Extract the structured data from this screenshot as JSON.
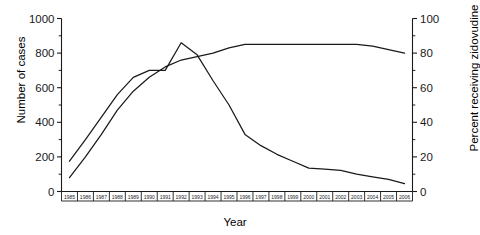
{
  "chart_data": {
    "type": "line",
    "title": "",
    "xlabel": "Year",
    "ylabel": "Number of cases",
    "ylabel_right": "Percent receiving zidovudine",
    "grid": false,
    "legend": "none",
    "x": [
      1985,
      1986,
      1987,
      1988,
      1989,
      1990,
      1991,
      1992,
      1993,
      1994,
      1995,
      1996,
      1997,
      1998,
      1999,
      2000,
      2001,
      2002,
      2003,
      2004,
      2005,
      2006
    ],
    "xtick_labels": [
      "1985",
      "1986",
      "1987",
      "1988",
      "1989",
      "1990",
      "1991",
      "1992",
      "1993",
      "1994",
      "1995",
      "1996",
      "1997",
      "1998",
      "1999",
      "2000",
      "2001",
      "2002",
      "2003",
      "2004",
      "2005",
      "2006"
    ],
    "ylim": [
      0,
      1000
    ],
    "ytick_labels": [
      "0",
      "200",
      "400",
      "600",
      "800",
      "1000"
    ],
    "ytick_values": [
      0,
      200,
      400,
      600,
      800,
      1000
    ],
    "ylim_right": [
      0,
      100
    ],
    "ytick_labels_right": [
      "0",
      "20",
      "40",
      "60",
      "80",
      "100"
    ],
    "ytick_values_right": [
      0,
      20,
      40,
      60,
      80,
      100
    ],
    "series": [
      {
        "name": "Number of cases",
        "axis": "left",
        "color": "#1a1a1a",
        "values": [
          175,
          300,
          430,
          560,
          660,
          700,
          700,
          860,
          790,
          640,
          500,
          330,
          265,
          215,
          175,
          135,
          130,
          122,
          100,
          85,
          70,
          45
        ]
      },
      {
        "name": "Percent receiving zidovudine",
        "axis": "right",
        "color": "#1a1a1a",
        "values": [
          8,
          20,
          33,
          47,
          58,
          66,
          72,
          76,
          78,
          80,
          83,
          85,
          85,
          85,
          85,
          85,
          85,
          85,
          85,
          84,
          82,
          80
        ]
      }
    ]
  }
}
